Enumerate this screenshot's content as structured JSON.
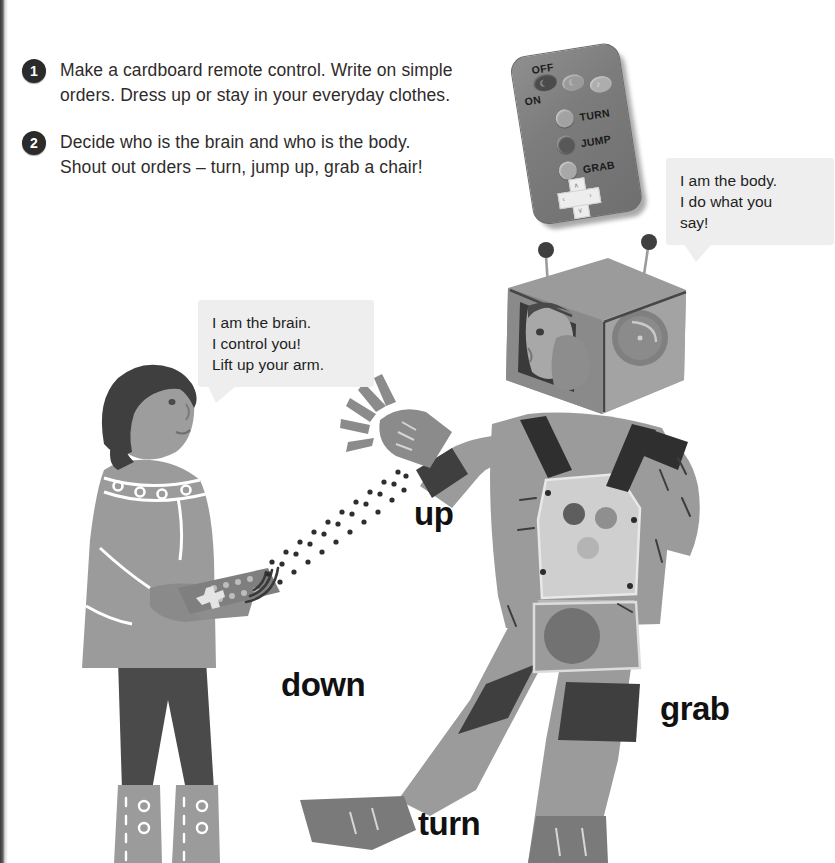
{
  "page": {
    "background": "#ffffff",
    "ink": "#231f20",
    "accent_gray": "#8f8f8f"
  },
  "instructions": [
    {
      "number": "1",
      "line1": "Make a cardboard remote control. Write on simple",
      "line2": "orders. Dress up or stay in your everyday clothes."
    },
    {
      "number": "2",
      "line1": "Decide who is the brain and who is the body.",
      "line2": "Shout out orders – turn, jump up, grab a chair!"
    }
  ],
  "remote": {
    "power_off_label": "OFF",
    "power_on_label": "ON",
    "buttons": [
      {
        "label": "TURN"
      },
      {
        "label": "JUMP"
      },
      {
        "label": "GRAB"
      }
    ],
    "dpad": {
      "up": "∧",
      "down": "∨",
      "left": "‹",
      "right": "›"
    }
  },
  "speech_bubbles": [
    {
      "speaker": "body",
      "line1": "I am the body.",
      "line2": "I do what you",
      "line3": "say!"
    },
    {
      "speaker": "brain",
      "line1": "I am the brain.",
      "line2": "I control you!",
      "line3": "Lift up your arm."
    }
  ],
  "action_words": {
    "up": "up",
    "down": "down",
    "grab": "grab",
    "turn": "turn"
  }
}
